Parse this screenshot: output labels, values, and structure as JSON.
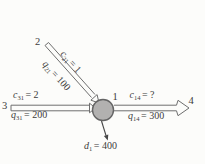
{
  "figure": {
    "background": "#fcfcfa",
    "arrow_color": "#6e6e6e",
    "text_color": "#3c3c3c",
    "node_fill": "#b2b1b0",
    "node_border": "#646464",
    "demand_arrow_color": "#474747"
  },
  "nodes": {
    "n1": "1",
    "n2": "2",
    "n3": "3",
    "n4": "4"
  },
  "labels": {
    "c21": {
      "v": "c",
      "sub": "21",
      "eq": "= 1"
    },
    "q21": {
      "v": "q",
      "sub": "21",
      "eq": "= 100"
    },
    "c31": {
      "v": "c",
      "sub": "31",
      "eq": "= 2"
    },
    "q31": {
      "v": "q",
      "sub": "31",
      "eq": "= 200"
    },
    "c14": {
      "v": "c",
      "sub": "14",
      "eq": "= ?"
    },
    "q14": {
      "v": "q",
      "sub": "14",
      "eq": "= 300"
    },
    "d1": {
      "v": "d",
      "sub": "1",
      "eq": "= 400"
    }
  }
}
